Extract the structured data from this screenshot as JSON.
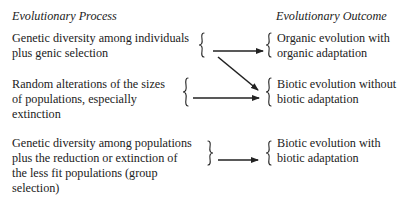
{
  "headers": {
    "process": "Evolutionary Process",
    "outcome": "Evolutionary Outcome"
  },
  "processes": [
    {
      "lines": [
        "Genetic diversity among individuals",
        "plus genic selection"
      ]
    },
    {
      "lines": [
        "Random alterations of the sizes",
        "of populations, especially",
        "extinction"
      ]
    },
    {
      "lines": [
        "Genetic diversity among populations",
        "plus the reduction or extinction of",
        "the less fit populations (group",
        "selection)"
      ]
    }
  ],
  "outcomes": [
    {
      "lines": [
        "Organic evolution with",
        "organic adaptation"
      ]
    },
    {
      "lines": [
        "Biotic evolution without",
        "biotic adaptation"
      ]
    },
    {
      "lines": [
        "Biotic evolution with",
        "biotic adaptation"
      ]
    }
  ],
  "arrows": [
    {
      "from": "process-1",
      "to": "outcome-1"
    },
    {
      "from": "process-1",
      "to": "outcome-2"
    },
    {
      "from": "process-2",
      "to": "outcome-2"
    },
    {
      "from": "process-3",
      "to": "outcome-3"
    }
  ]
}
